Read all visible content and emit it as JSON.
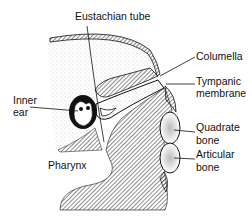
{
  "diagram": {
    "labels": {
      "eustachian_tube": "Eustachian tube",
      "columella": "Columella",
      "tympanic_membrane_1": "Tympanic",
      "tympanic_membrane_2": "membrane",
      "inner_ear_1": "Inner",
      "inner_ear_2": "ear",
      "quadrate_1": "Quadrate",
      "quadrate_2": "bone",
      "articular_1": "Articular",
      "articular_2": "bone",
      "pharynx": "Pharynx"
    },
    "colors": {
      "ink": "#111111",
      "stipple": "#e6e6e6",
      "background": "#ffffff"
    }
  }
}
